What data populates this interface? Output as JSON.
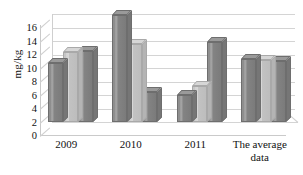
{
  "chart_data": {
    "type": "bar",
    "title": "",
    "subtitle": "",
    "xlabel": "",
    "ylabel": "mg/kg",
    "ylim": [
      0,
      16
    ],
    "yticks": [
      0,
      2,
      4,
      6,
      8,
      10,
      12,
      14,
      16
    ],
    "ytick_labels": [
      "0",
      "2",
      "4",
      "6",
      "8",
      "10",
      "12",
      "14",
      "16"
    ],
    "grid": true,
    "legend": "none",
    "style": "3d-clustered-column",
    "categories": [
      "2009",
      "2010",
      "2011",
      "The average data"
    ],
    "series": [
      {
        "name": "Series 1",
        "color": "#8a8a8a",
        "values": [
          8.7,
          15.8,
          4.0,
          9.3
        ]
      },
      {
        "name": "Series 2",
        "color": "#c8c8c8",
        "values": [
          10.3,
          11.5,
          5.4,
          9.2
        ]
      },
      {
        "name": "Series 3",
        "color": "#8a8a8a",
        "values": [
          10.5,
          4.4,
          11.9,
          9.0
        ]
      }
    ],
    "colors": {
      "dark_bar": "#8a8a8a",
      "light_bar": "#c8c8c8",
      "gridline": "#d4d4d4",
      "axis": "#c9c9c9",
      "background": "#ffffff",
      "text": "#111111"
    }
  },
  "axis": {
    "y_title": "mg/kg"
  },
  "category_labels": [
    {
      "line1": "2009",
      "line2": ""
    },
    {
      "line1": "2010",
      "line2": ""
    },
    {
      "line1": "2011",
      "line2": ""
    },
    {
      "line1": "The average",
      "line2": "data"
    }
  ]
}
